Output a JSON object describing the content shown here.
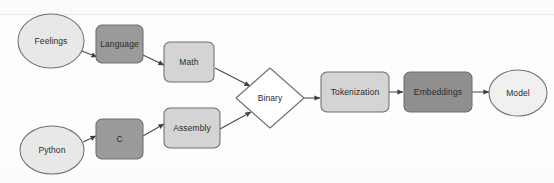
{
  "diagram": {
    "background_color": "#fdfdfd",
    "palette": {
      "ellipse_fill": "#e8e8e8",
      "light_box_fill": "#d4d4d4",
      "dark_box_fill": "#8f8f8f",
      "stroke": "#6e6e6e",
      "arrow": "#4a4a4a",
      "text": "#2b2b2b"
    },
    "nodes": [
      {
        "id": "feelings",
        "label": "Feelings",
        "shape": "ellipse",
        "fill": "#e8e8e8",
        "cx": 51,
        "cy": 41,
        "rx": 33,
        "ry": 27
      },
      {
        "id": "language",
        "label": "Language",
        "shape": "rounded-rect",
        "fill": "#9a9a9a",
        "x": 96,
        "y": 25,
        "w": 47,
        "h": 38
      },
      {
        "id": "math",
        "label": "Math",
        "shape": "rounded-rect",
        "fill": "#d4d4d4",
        "x": 164,
        "y": 42,
        "w": 50,
        "h": 40
      },
      {
        "id": "python",
        "label": "Python",
        "shape": "ellipse",
        "fill": "#e8e8e8",
        "cx": 52,
        "cy": 150,
        "rx": 32,
        "ry": 24
      },
      {
        "id": "c",
        "label": "C",
        "shape": "rounded-rect",
        "fill": "#9a9a9a",
        "x": 96,
        "y": 119,
        "w": 47,
        "h": 40
      },
      {
        "id": "assembly",
        "label": "Assembly",
        "shape": "rounded-rect",
        "fill": "#d4d4d4",
        "x": 164,
        "y": 108,
        "w": 56,
        "h": 40
      },
      {
        "id": "binary",
        "label": "Binary",
        "shape": "diamond",
        "fill": "#ffffff",
        "cx": 270,
        "cy": 98,
        "rx": 34,
        "ry": 30
      },
      {
        "id": "tokenization",
        "label": "Tokenization",
        "shape": "rounded-rect",
        "fill": "#d4d4d4",
        "x": 321,
        "y": 72,
        "w": 68,
        "h": 40
      },
      {
        "id": "embeddings",
        "label": "Embeddings",
        "shape": "rounded-rect",
        "fill": "#8f8f8f",
        "x": 404,
        "y": 72,
        "w": 68,
        "h": 40
      },
      {
        "id": "model",
        "label": "Model",
        "shape": "ellipse",
        "fill": "#f0f0f0",
        "cx": 518,
        "cy": 93,
        "rx": 29,
        "ry": 23
      }
    ],
    "edges": [
      {
        "from": "feelings",
        "to": "language"
      },
      {
        "from": "language",
        "to": "math"
      },
      {
        "from": "math",
        "to": "binary"
      },
      {
        "from": "python",
        "to": "c"
      },
      {
        "from": "c",
        "to": "assembly"
      },
      {
        "from": "assembly",
        "to": "binary"
      },
      {
        "from": "binary",
        "to": "tokenization"
      },
      {
        "from": "tokenization",
        "to": "embeddings"
      },
      {
        "from": "embeddings",
        "to": "model"
      }
    ]
  }
}
